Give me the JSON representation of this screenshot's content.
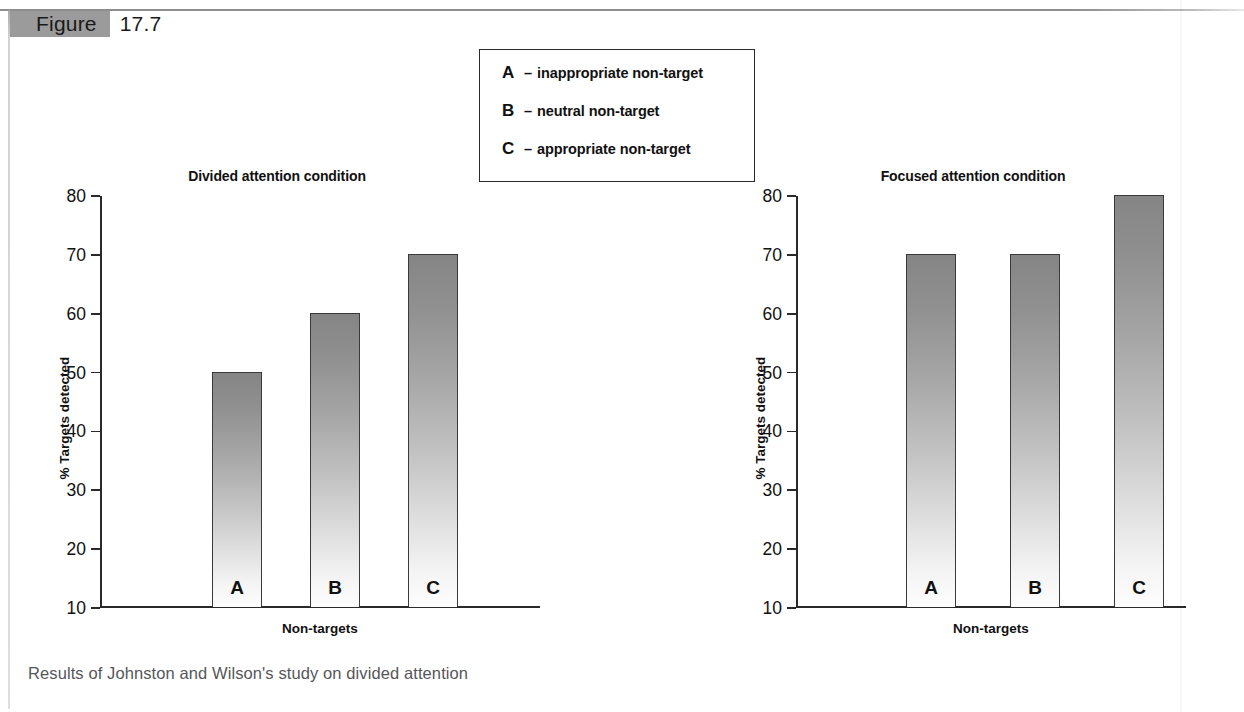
{
  "figure": {
    "label": "Figure",
    "number": "17.7",
    "caption": "Results of Johnston and Wilson's study on divided attention"
  },
  "legend": {
    "items": [
      {
        "key": "A",
        "dash": "–",
        "text": "inappropriate non-target"
      },
      {
        "key": "B",
        "dash": "–",
        "text": "neutral non-target"
      },
      {
        "key": "C",
        "dash": "–",
        "text": "appropriate non-target"
      }
    ]
  },
  "colors": {
    "bar_top": "#858585",
    "bar_bottom": "#fdfdfd",
    "axis": "#2a2a2a",
    "header_chip": "#9b9b9b",
    "caption_text": "#55565a"
  },
  "chart_data": [
    {
      "type": "bar",
      "title": "Divided attention condition",
      "xlabel": "Non-targets",
      "ylabel": "% Targets detected",
      "categories": [
        "A",
        "B",
        "C"
      ],
      "values": [
        50,
        60,
        70
      ],
      "ylim": [
        10,
        80
      ],
      "yticks": [
        80,
        70,
        60,
        50,
        40,
        30,
        20,
        10
      ],
      "grid": false,
      "legend": "external-box"
    },
    {
      "type": "bar",
      "title": "Focused attention condition",
      "xlabel": "Non-targets",
      "ylabel": "% Targets detected",
      "categories": [
        "A",
        "B",
        "C"
      ],
      "values": [
        70,
        70,
        80
      ],
      "ylim": [
        10,
        80
      ],
      "yticks": [
        80,
        70,
        60,
        50,
        40,
        30,
        20,
        10
      ],
      "grid": false,
      "legend": "external-box"
    }
  ]
}
